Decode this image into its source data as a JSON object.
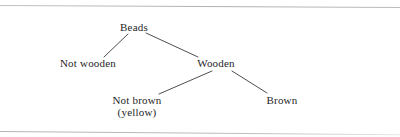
{
  "figure": {
    "type": "classification-tree",
    "background_color": "#ffffff",
    "ink_color": "#262628",
    "rule_color": "#b9b9bb",
    "rules": [
      {
        "name": "top-rule",
        "y": 5
      },
      {
        "name": "bottom-rule",
        "y": 131
      }
    ],
    "nodes": [
      {
        "id": "root",
        "label": "Beads",
        "sublabel": "",
        "x": 134,
        "y": 27,
        "level": 0
      },
      {
        "id": "not-wooden",
        "label": "Not wooden",
        "sublabel": "",
        "x": 88,
        "y": 63,
        "level": 1
      },
      {
        "id": "wooden",
        "label": "Wooden",
        "sublabel": "",
        "x": 216,
        "y": 63,
        "level": 1
      },
      {
        "id": "not-brown",
        "label": "Not brown",
        "sublabel": "(yellow)",
        "x": 137,
        "y": 100,
        "level": 2
      },
      {
        "id": "brown",
        "label": "Brown",
        "sublabel": "",
        "x": 282,
        "y": 100,
        "level": 2
      }
    ],
    "edges": [
      {
        "from": "root",
        "to": "not-wooden",
        "x1": 128,
        "y1": 34,
        "x2": 104,
        "y2": 57
      },
      {
        "from": "root",
        "to": "wooden",
        "x1": 146,
        "y1": 33,
        "x2": 198,
        "y2": 57
      },
      {
        "from": "wooden",
        "to": "not-brown",
        "x1": 212,
        "y1": 71,
        "x2": 159,
        "y2": 94
      },
      {
        "from": "wooden",
        "to": "brown",
        "x1": 232,
        "y1": 71,
        "x2": 267,
        "y2": 93
      }
    ]
  }
}
